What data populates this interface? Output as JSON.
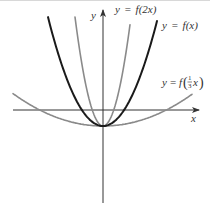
{
  "diagram": {
    "type": "function-graph",
    "axes": {
      "x_label": "x",
      "y_label": "y",
      "origin_px": [
        103,
        110
      ]
    },
    "vertex_px": [
      103,
      126
    ],
    "curves": [
      {
        "id": "f_x",
        "label": "y = f(x)",
        "color": "#1a1a1a",
        "width": 2,
        "coef": 0.036
      },
      {
        "id": "f_2x",
        "label": "y = f(2x)",
        "color": "#8a8a8a",
        "width": 1.6,
        "coef": 0.139
      },
      {
        "id": "f_third_x",
        "label_prefix": "y = f",
        "label_num": "1",
        "label_den": "3",
        "label_var": "x",
        "color": "#8a8a8a",
        "width": 1.6,
        "coef": 0.004
      }
    ],
    "colors": {
      "axis": "#333333",
      "dark_curve": "#1a1a1a",
      "light_curve": "#8a8a8a"
    }
  },
  "labels": {
    "y_axis": "y",
    "x_axis": "x",
    "f2x_y": "y",
    "f2x_eq": "=",
    "f2x_f": "f",
    "f2x_arg": "(2x)",
    "fx_y": "y",
    "fx_eq": "=",
    "fx_f": "f",
    "fx_arg": "(x)",
    "fthird_y": "y",
    "fthird_eq": "=",
    "fthird_f": "f",
    "fthird_num": "1",
    "fthird_den": "3",
    "fthird_var": "x"
  }
}
